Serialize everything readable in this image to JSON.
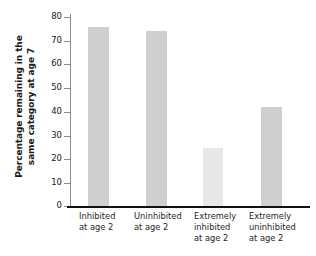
{
  "chart_data": {
    "type": "bar",
    "title": "",
    "xlabel": "",
    "ylabel": "Percentage remaining in the same category at age 7",
    "ylabel_lines": [
      "Percentage remaining in the",
      "same category at age 7"
    ],
    "categories": [
      "Inhibited at age 2",
      "Uninhibited at age 2",
      "Extremely inhibited at age 2",
      "Extremely uninhibited at age 2"
    ],
    "category_lines": [
      [
        "Inhibited",
        "at age 2"
      ],
      [
        "Uninhibited",
        "at age 2"
      ],
      [
        "Extremely",
        "inhibited",
        "at age 2"
      ],
      [
        "Extremely",
        "uninhibited",
        "at age 2"
      ]
    ],
    "values": [
      76,
      74,
      25,
      42
    ],
    "bar_colors": [
      "#cfcfcf",
      "#cfcfcf",
      "#e8e8e8",
      "#cfcfcf"
    ],
    "ylim": [
      0,
      80
    ],
    "yticks": [
      0,
      10,
      20,
      30,
      40,
      50,
      60,
      70,
      80
    ],
    "ytick_labels": [
      "0",
      "10",
      "20",
      "30",
      "40",
      "50",
      "60",
      "70",
      "80"
    ],
    "grid": false,
    "legend": "none"
  },
  "colors": {
    "background": "#ffffff",
    "axis_line": "#111111",
    "spine": "#8c8c8c",
    "tick_text": "#1a1a1a",
    "category_text": "#262626",
    "bar_dark": "#cfcfcf",
    "bar_light": "#e8e8e8"
  }
}
